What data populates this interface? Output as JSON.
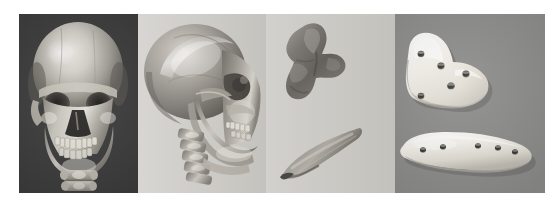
{
  "figure": {
    "title": "Three-dimensional CT skull reconstructions and custom cranio-maxillofacial implants",
    "background_color": "#ffffff",
    "width_px": 559,
    "height_px": 207,
    "panel_count": 4
  },
  "panels": [
    {
      "id": "panel-1",
      "label": "a",
      "name": "frontal-3d-ct-skull",
      "caption": "Frontal view 3D CT reconstruction of skull",
      "background_color": "#3e3e3f",
      "subject": "human skull",
      "view": "anterior / frontal",
      "rendering": "shaded surface 3D CT volume rendering",
      "visible_structures": [
        "cranial vault",
        "frontal bone",
        "orbits",
        "nasal aperture",
        "maxilla",
        "dental arch",
        "mandible",
        "cervical vertebrae"
      ]
    },
    {
      "id": "panel-2",
      "label": "b",
      "name": "lateral-oblique-3d-ct-skull",
      "caption": "Lateral oblique view 3D CT reconstruction of skull",
      "background_color": "#cfcdc8",
      "subject": "human skull",
      "view": "lateral oblique / three-quarter",
      "rendering": "shaded surface 3D CT volume rendering",
      "visible_structures": [
        "parietal bone",
        "temporal bone",
        "zygomatic arch",
        "orbit",
        "maxilla",
        "mandibular ramus",
        "teeth",
        "cervical spine"
      ]
    },
    {
      "id": "panel-3",
      "label": "c",
      "name": "bone-graft-models",
      "caption": "Segmented bone graft / defect models",
      "background_color": "#cbc9c4",
      "objects": [
        {
          "name": "irregular-bone-fragment",
          "shape": "irregular butterfly-shaped block",
          "color": "#6c6a66",
          "position": "upper"
        },
        {
          "name": "elongated-bone-sliver",
          "shape": "tapered elongated strut",
          "color": "#7b7974",
          "position": "lower"
        }
      ]
    },
    {
      "id": "panel-4",
      "label": "d",
      "name": "custom-implant-plates",
      "caption": "Fabricated patient-specific implant plates",
      "background_color": "#8d8d8b",
      "objects": [
        {
          "name": "l-shaped-implant-plate",
          "shape": "L-shaped / boot-shaped plate",
          "color": "#f2efe8",
          "screw_hole_count": 5,
          "position": "upper"
        },
        {
          "name": "elongated-implant-plate",
          "shape": "elongated contoured bar",
          "color": "#f4f1ea",
          "screw_hole_count": 5,
          "position": "lower"
        }
      ]
    }
  ],
  "icons": {
    "skull_front": "skull-front-icon",
    "skull_lateral": "skull-lateral-icon",
    "bone_fragment": "bone-fragment-icon",
    "implant_plate": "implant-plate-icon"
  }
}
